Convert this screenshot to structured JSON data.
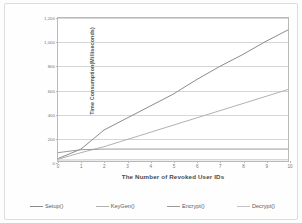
{
  "chart_data": {
    "type": "line",
    "title": "",
    "subtitle": "",
    "xlabel": "The Number of Revoked User IDs",
    "ylabel": "Time Consumption(Milliseconds)",
    "x": [
      0,
      1,
      2,
      3,
      4,
      5,
      6,
      7,
      8,
      9,
      10
    ],
    "xlim": [
      0,
      10
    ],
    "ylim": [
      0,
      1200
    ],
    "xticks": [
      "0",
      "1",
      "2",
      "3",
      "4",
      "5",
      "6",
      "7",
      "8",
      "9",
      "10"
    ],
    "yticks": [
      "0",
      "200",
      "400",
      "600",
      "800",
      "1,000",
      "1,200"
    ],
    "ytick_values": [
      0,
      200,
      400,
      600,
      800,
      1000,
      1200
    ],
    "grid": "horizontal",
    "legend_position": "bottom",
    "series": [
      {
        "name": "Setup()",
        "color": "#8a8a8a",
        "values": [
          20,
          100,
          260,
          360,
          460,
          560,
          680,
          790,
          890,
          1000,
          1100
        ]
      },
      {
        "name": "KeyGen()",
        "color": "#b0b0b0",
        "values": [
          15,
          70,
          120,
          180,
          240,
          300,
          360,
          420,
          480,
          540,
          600
        ]
      },
      {
        "name": "Encrypt()",
        "color": "#9a9a9a",
        "values": [
          70,
          95,
          100,
          100,
          100,
          100,
          100,
          100,
          100,
          100,
          100
        ]
      },
      {
        "name": "Decrypt()",
        "color": "#c4c4c4",
        "values": [
          8,
          9,
          10,
          10,
          10,
          10,
          10,
          10,
          10,
          10,
          10
        ]
      }
    ]
  },
  "legend": {
    "items": [
      {
        "label": "Setup()"
      },
      {
        "label": "KeyGen()"
      },
      {
        "label": "Encrypt()"
      },
      {
        "label": "Decrypt()"
      }
    ]
  }
}
